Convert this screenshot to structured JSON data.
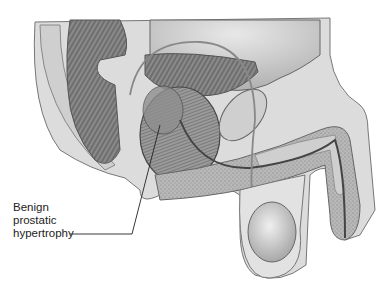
{
  "figure": {
    "annotation": {
      "lines": [
        "Benign",
        "prostatic",
        "hypertrophy"
      ]
    }
  }
}
